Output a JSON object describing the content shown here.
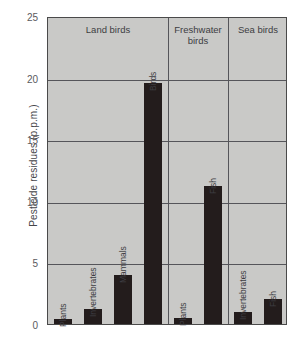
{
  "chart_data": {
    "type": "bar",
    "title": "",
    "xlabel": "",
    "ylabel": "Pesticide residues (p.p.m.)",
    "ylim": [
      0,
      25
    ],
    "yticks": [
      "0",
      "5",
      "10",
      "15",
      "20",
      "25"
    ],
    "grid": true,
    "legend": "none",
    "groups": [
      {
        "name": "Land birds",
        "categories": [
          "Plants",
          "Invertebrates",
          "Mammals",
          "Birds"
        ],
        "values": [
          0.4,
          1.2,
          4.0,
          19.6
        ]
      },
      {
        "name": "Freshwater birds",
        "categories": [
          "Plants",
          "Fish"
        ],
        "values": [
          0.5,
          11.2
        ]
      },
      {
        "name": "Sea birds",
        "categories": [
          "Invertebrates",
          "Fish"
        ],
        "values": [
          1.0,
          2.0
        ]
      }
    ],
    "colors": {
      "bar": "#231c1c",
      "plot_background": "#c9c9c7",
      "grid": "#55555a",
      "frame": "#4a4a4a",
      "text": "#3d3d42",
      "page_background": "#ffffff"
    }
  }
}
